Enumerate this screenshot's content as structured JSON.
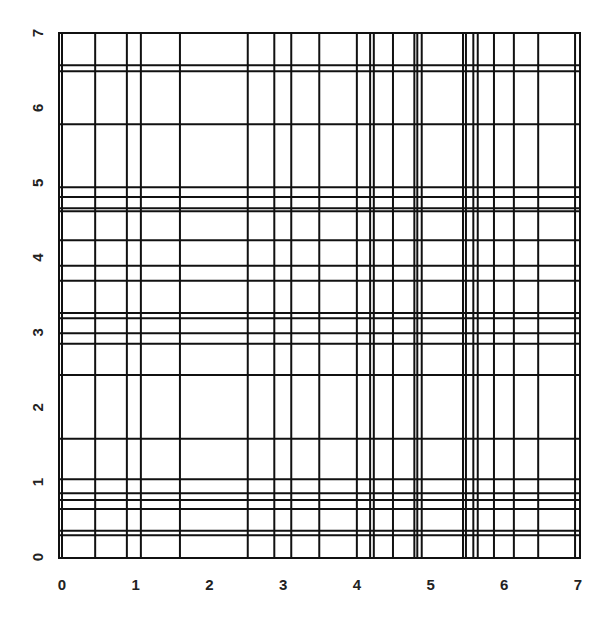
{
  "chart_data": {
    "type": "line",
    "subtype": "abline-grid",
    "title": "",
    "xlabel": "",
    "ylabel": "",
    "xlim": [
      0,
      7
    ],
    "ylim": [
      0,
      7
    ],
    "grid": false,
    "legend": null,
    "x_ticks": [
      "0",
      "1",
      "2",
      "3",
      "4",
      "5",
      "6",
      "7"
    ],
    "y_ticks": [
      "0",
      "1",
      "2",
      "3",
      "4",
      "5",
      "6",
      "7"
    ],
    "vertical_lines_x": [
      0.0,
      0.45,
      0.88,
      1.07,
      1.6,
      2.52,
      2.88,
      3.11,
      3.49,
      4.0,
      4.18,
      4.23,
      4.49,
      4.78,
      4.82,
      4.88,
      5.44,
      5.48,
      5.58,
      5.64,
      5.86,
      6.13,
      6.46,
      6.96
    ],
    "horizontal_lines_y": [
      0.29,
      0.35,
      0.64,
      0.76,
      0.85,
      1.04,
      1.58,
      2.43,
      2.85,
      2.99,
      3.19,
      3.26,
      3.69,
      3.89,
      4.23,
      4.62,
      4.66,
      4.81,
      4.94,
      5.78,
      6.49,
      6.57
    ],
    "line_color": "#111111",
    "background": "#ffffff"
  }
}
